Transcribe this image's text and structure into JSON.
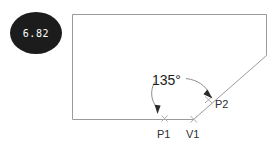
{
  "figure": {
    "background_color": "#ffffff",
    "line_color": "#9b9b9b",
    "label_color": "#303030"
  },
  "badge": {
    "value": "6.82",
    "shape": "oval",
    "fill_color": "#1c1c1c",
    "text_color": "#ffffff"
  },
  "annotations": {
    "angle": {
      "value": "135",
      "unit": "°",
      "display": "135°"
    },
    "points": [
      {
        "id": "p1",
        "label": "P1"
      },
      {
        "id": "v1",
        "label": "V1"
      },
      {
        "id": "p2",
        "label": "P2"
      }
    ]
  },
  "shape": {
    "name": "chamfered-rectangle-outline",
    "vertices_description": "rectangle with lower-right corner replaced by a 135 degree chamfer line"
  }
}
